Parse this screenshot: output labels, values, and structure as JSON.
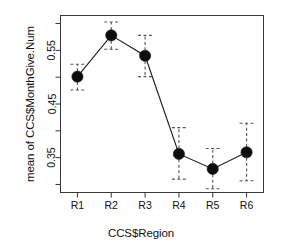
{
  "chart_data": {
    "type": "line",
    "title": "",
    "subtitle": "",
    "xlabel": "CCS$Region",
    "ylabel": "mean of CCS$MonthGive.Num",
    "categories": [
      "R1",
      "R2",
      "R3",
      "R4",
      "R5",
      "R6"
    ],
    "values": [
      0.501,
      0.578,
      0.54,
      0.357,
      0.329,
      0.36
    ],
    "errors_upper": [
      0.524,
      0.603,
      0.578,
      0.406,
      0.367,
      0.414
    ],
    "errors_lower": [
      0.476,
      0.552,
      0.501,
      0.31,
      0.292,
      0.307
    ],
    "series": [
      {
        "name": "mean of CCS$MonthGive.Num",
        "values": [
          0.501,
          0.578,
          0.54,
          0.357,
          0.329,
          0.36
        ]
      }
    ],
    "ylim": [
      0.285,
      0.615
    ],
    "xlim": [
      0.5,
      6.5
    ],
    "ytick_labels": [
      "0.35",
      "0.45",
      "0.55"
    ],
    "ytick_values": [
      0.35,
      0.45,
      0.55
    ],
    "yminor_tick_values": [
      0.3,
      0.4,
      0.5,
      0.6
    ],
    "xtick_labels": [
      "R1",
      "R2",
      "R3",
      "R4",
      "R5",
      "R6"
    ],
    "grid": false,
    "legend": null,
    "marker": "filled-circle",
    "errorbar_style": "dashed-with-caps",
    "colors": {
      "line": "#1a1a1a",
      "marker": "#0d0d0d",
      "errorbar": "#555555",
      "axis": "#333333",
      "background": "#ffffff",
      "text": "#111111"
    }
  },
  "figure": {
    "xlabel": "CCS$Region",
    "ylabel": "mean of CCS$MonthGive.Num"
  }
}
